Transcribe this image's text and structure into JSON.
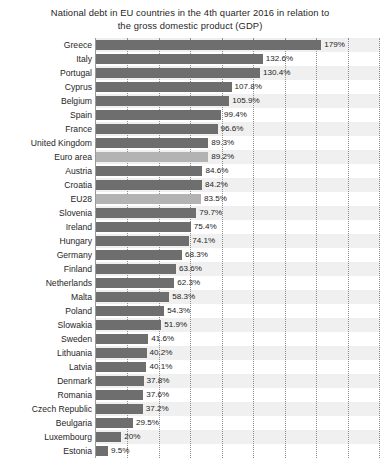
{
  "chart_data": {
    "type": "bar",
    "orientation": "horizontal",
    "title": "National debt in EU countries in the 4th quarter 2016 in relation to the gross domestic product (GDP)",
    "title_line1": "National debt in EU countries in the 4th quarter 2016 in relation to",
    "title_line2": "the gross domestic product (GDP)",
    "xlabel": "",
    "ylabel": "",
    "xlim": [
      0,
      225
    ],
    "xticks": [
      0,
      25,
      50,
      75,
      100,
      125,
      150,
      175,
      200,
      225
    ],
    "grid": "vertical-dotted",
    "legend": "none",
    "unit": "% of GDP",
    "colors": {
      "bar": "#6e6e6e",
      "bar_aggregate": "#b3b3b3",
      "row_band": "#f0f0f0",
      "gridline": "#8d8d8d",
      "text": "#1f1f1f"
    },
    "categories": [
      "Greece",
      "Italy",
      "Portugal",
      "Cyprus",
      "Belgium",
      "Spain",
      "France",
      "United Kingdom",
      "Euro area",
      "Austria",
      "Croatia",
      "EU28",
      "Slovenia",
      "Ireland",
      "Hungary",
      "Germany",
      "Finland",
      "Netherlands",
      "Malta",
      "Poland",
      "Slowakia",
      "Sweden",
      "Lithuania",
      "Latvia",
      "Denmark",
      "Romania",
      "Czech Republic",
      "Beulgaria",
      "Luxembourg",
      "Estonia"
    ],
    "values": [
      179,
      132.6,
      130.4,
      107.8,
      105.9,
      99.4,
      96.6,
      89.3,
      89.2,
      84.6,
      84.2,
      83.5,
      79.7,
      75.4,
      74.1,
      68.3,
      63.6,
      62.3,
      58.3,
      54.3,
      51.9,
      41.6,
      40.2,
      40.1,
      37.8,
      37.6,
      37.2,
      29.5,
      20,
      9.5
    ],
    "value_labels": [
      "179%",
      "132.6%",
      "130.4%",
      "107.8%",
      "105.9%",
      "99.4%",
      "96.6%",
      "89.3%",
      "89.2%",
      "84.6%",
      "84.2%",
      "83.5%",
      "79.7%",
      "75.4%",
      "74.1%",
      "68.3%",
      "63.6%",
      "62.3%",
      "58.3%",
      "54.3%",
      "51.9%",
      "41.6%",
      "40.2%",
      "40.1%",
      "37.8%",
      "37.6%",
      "37.2%",
      "29.5%",
      "20%",
      "9.5%"
    ],
    "aggregate_rows": [
      "Euro area",
      "EU28"
    ]
  }
}
